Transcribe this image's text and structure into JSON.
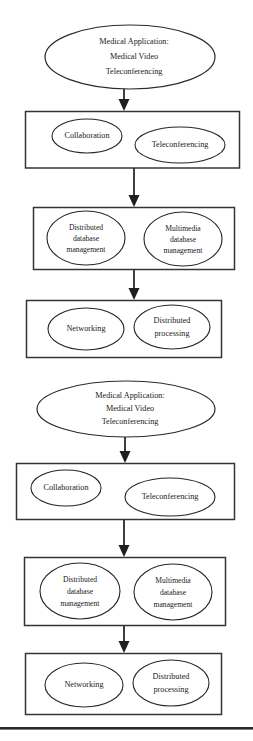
{
  "diagram": {
    "type": "flowchart",
    "orientation": "top-to-bottom",
    "colors": {
      "background": "#ffffff",
      "stroke": "#262626",
      "box_stroke": "#343434",
      "text": "#1a1a1a",
      "arrow": "#1f1f1f"
    },
    "groups": [
      {
        "id": "group-1",
        "root": {
          "shape": "ellipse",
          "lines": [
            "Medical Application:",
            "Medical Video",
            "Teleconferencing"
          ]
        },
        "layers": [
          {
            "id": "layer-1-1",
            "shape": "box",
            "nodes": [
              {
                "shape": "ellipse",
                "lines": [
                  "Collaboration"
                ]
              },
              {
                "shape": "ellipse",
                "lines": [
                  "Teleconferencing"
                ]
              }
            ]
          },
          {
            "id": "layer-1-2",
            "shape": "box",
            "nodes": [
              {
                "shape": "ellipse",
                "lines": [
                  "Distributed",
                  "database",
                  "management"
                ]
              },
              {
                "shape": "ellipse",
                "lines": [
                  "Multimedia",
                  "database",
                  "management"
                ]
              }
            ]
          },
          {
            "id": "layer-1-3",
            "shape": "box",
            "nodes": [
              {
                "shape": "ellipse",
                "lines": [
                  "Networking"
                ]
              },
              {
                "shape": "ellipse",
                "lines": [
                  "Distributed",
                  "processing"
                ]
              }
            ]
          }
        ]
      },
      {
        "id": "group-2",
        "root": {
          "shape": "ellipse",
          "lines": [
            "Medical Application:",
            "Medical Video",
            "Teleconferencing"
          ]
        },
        "layers": [
          {
            "id": "layer-2-1",
            "shape": "box",
            "nodes": [
              {
                "shape": "ellipse",
                "lines": [
                  "Collaboration"
                ]
              },
              {
                "shape": "ellipse",
                "lines": [
                  "Teleconferencing"
                ]
              }
            ]
          },
          {
            "id": "layer-2-2",
            "shape": "box",
            "nodes": [
              {
                "shape": "ellipse",
                "lines": [
                  "Distributed",
                  "database",
                  "management"
                ]
              },
              {
                "shape": "ellipse",
                "lines": [
                  "Multimedia",
                  "database",
                  "management"
                ]
              }
            ]
          },
          {
            "id": "layer-2-3",
            "shape": "box",
            "nodes": [
              {
                "shape": "ellipse",
                "lines": [
                  "Networking"
                ]
              },
              {
                "shape": "ellipse",
                "lines": [
                  "Distributed",
                  "processing"
                ]
              }
            ]
          }
        ]
      }
    ],
    "connectors": [
      {
        "id": "arrow-1",
        "from": "group-1.root",
        "to": "layer-1-1",
        "style": "solid-filled-arrowhead"
      },
      {
        "id": "arrow-2",
        "from": "layer-1-1",
        "to": "layer-1-2",
        "style": "solid-filled-arrowhead"
      },
      {
        "id": "arrow-3",
        "from": "layer-1-2",
        "to": "layer-1-3",
        "style": "solid-filled-arrowhead"
      },
      {
        "id": "arrow-4",
        "from": "group-2.root",
        "to": "layer-2-1",
        "style": "solid-filled-arrowhead"
      },
      {
        "id": "arrow-5",
        "from": "layer-2-1",
        "to": "layer-2-2",
        "style": "solid-filled-arrowhead"
      },
      {
        "id": "arrow-6",
        "from": "layer-2-2",
        "to": "layer-2-3",
        "style": "solid-filled-arrowhead"
      }
    ],
    "footer_rule": {
      "present": true
    }
  }
}
